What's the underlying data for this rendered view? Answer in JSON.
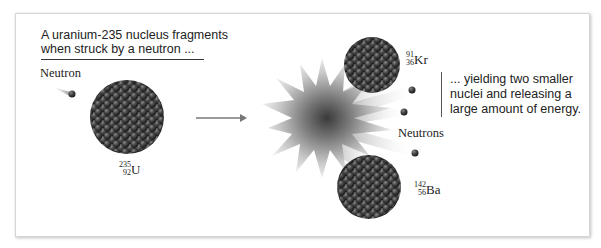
{
  "diagram": {
    "type": "nuclear-fission-illustration",
    "caption_left": {
      "line1": "A uranium-235 nucleus fragments",
      "line2": "when struck by a neutron ..."
    },
    "caption_right": {
      "line1": "... yielding two smaller",
      "line2": "nuclei and releasing a",
      "line3": "large amount of energy."
    },
    "labels": {
      "incoming_neutron": "Neutron",
      "outgoing_neutrons": "Neutrons"
    },
    "nuclei": {
      "uranium": {
        "mass": "235",
        "atomic": "92",
        "symbol": "U"
      },
      "krypton": {
        "mass": "91",
        "atomic": "36",
        "symbol": "Kr"
      },
      "barium": {
        "mass": "142",
        "atomic": "56",
        "symbol": "Ba"
      }
    },
    "colors": {
      "nucleon": "#3a3a3a",
      "burst": "#8a8a8a",
      "text": "#222222"
    }
  }
}
